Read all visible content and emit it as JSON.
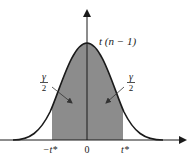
{
  "diagram": {
    "type": "t-distribution density curve with shaded central region",
    "curve_label": "t (n − 1)",
    "x_axis": {
      "tick_labels": [
        "−t*",
        "0",
        "t*"
      ]
    },
    "annotations": {
      "left_tail_fraction": {
        "numerator": "γ",
        "denominator": "2"
      },
      "right_tail_fraction": {
        "numerator": "γ",
        "denominator": "2"
      }
    },
    "colors": {
      "shaded_region": "#8c8c8c",
      "curve": "#1a1a1a",
      "axes": "#1a1a1a",
      "background": "#ffffff"
    }
  }
}
